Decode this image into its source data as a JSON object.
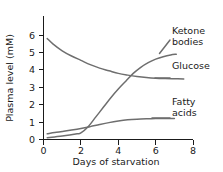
{
  "figure": {
    "background": "#ffffff",
    "curve_color": "#6e6e6e",
    "axis_color": "#1a1a1a"
  },
  "axes": {
    "x_title": "Days of starvation",
    "y_title": "Plasma level (mM)",
    "x_ticks": [
      "0",
      "2",
      "4",
      "6",
      "8"
    ],
    "y_ticks": [
      "0",
      "1",
      "2",
      "3",
      "4",
      "5",
      "6"
    ]
  },
  "labels": {
    "ketone": "Ketone\nbodies",
    "glucose": "Glucose",
    "fatty": "Fatty\nacids"
  },
  "chart_data": {
    "type": "line",
    "title": "",
    "xlabel": "Days of starvation",
    "ylabel": "Plasma level (mM)",
    "xlim": [
      0,
      8
    ],
    "ylim": [
      0,
      6
    ],
    "xticks": [
      0,
      2,
      4,
      6,
      8
    ],
    "yticks": [
      0,
      1,
      2,
      3,
      4,
      5,
      6
    ],
    "grid": false,
    "legend_position": "right-inline-labels",
    "series": [
      {
        "name": "Glucose",
        "color": "#6e6e6e",
        "x": [
          0.2,
          0.5,
          1.0,
          1.5,
          2.0,
          2.5,
          3.0,
          3.5,
          4.0,
          4.5,
          5.0,
          5.5,
          6.0,
          6.5,
          7.0,
          7.5
        ],
        "y": [
          5.8,
          5.5,
          5.1,
          4.8,
          4.55,
          4.3,
          4.1,
          3.95,
          3.8,
          3.7,
          3.62,
          3.56,
          3.52,
          3.5,
          3.49,
          3.48
        ]
      },
      {
        "name": "Ketone bodies",
        "color": "#6e6e6e",
        "x": [
          0.2,
          0.6,
          1.0,
          1.4,
          1.8,
          2.0,
          2.4,
          2.8,
          3.2,
          3.6,
          4.0,
          4.4,
          4.8,
          5.2,
          5.6,
          6.0,
          6.4,
          6.8,
          7.1
        ],
        "y": [
          0.1,
          0.15,
          0.2,
          0.26,
          0.33,
          0.38,
          0.75,
          1.3,
          1.85,
          2.4,
          2.9,
          3.35,
          3.8,
          4.15,
          4.42,
          4.62,
          4.76,
          4.86,
          4.9
        ]
      },
      {
        "name": "Fatty acids",
        "color": "#6e6e6e",
        "x": [
          0.2,
          0.6,
          1.0,
          1.5,
          2.0,
          2.5,
          3.0,
          3.5,
          4.0,
          4.5,
          5.0,
          5.5,
          6.0,
          6.5,
          7.0
        ],
        "y": [
          0.33,
          0.4,
          0.46,
          0.54,
          0.63,
          0.74,
          0.86,
          0.97,
          1.06,
          1.13,
          1.17,
          1.19,
          1.2,
          1.2,
          1.2
        ]
      }
    ]
  }
}
